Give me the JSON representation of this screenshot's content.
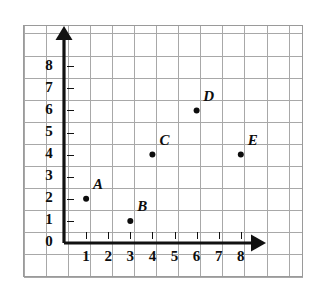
{
  "chart_data": {
    "type": "scatter",
    "title": "",
    "xlabel": "",
    "ylabel": "",
    "xlim": [
      0,
      9
    ],
    "ylim": [
      0,
      9
    ],
    "grid": true,
    "legend": null,
    "x_ticks": [
      "1",
      "2",
      "3",
      "4",
      "5",
      "6",
      "7",
      "8"
    ],
    "y_ticks": [
      "0",
      "1",
      "2",
      "3",
      "4",
      "5",
      "6",
      "7",
      "8"
    ],
    "x_tick_values": [
      1,
      2,
      3,
      4,
      5,
      6,
      7,
      8
    ],
    "y_tick_values": [
      0,
      1,
      2,
      3,
      4,
      5,
      6,
      7,
      8
    ],
    "points": [
      {
        "label": "A",
        "x": 1,
        "y": 2
      },
      {
        "label": "B",
        "x": 3,
        "y": 1
      },
      {
        "label": "C",
        "x": 4,
        "y": 4
      },
      {
        "label": "D",
        "x": 6,
        "y": 6
      },
      {
        "label": "E",
        "x": 8,
        "y": 4
      }
    ],
    "colors": {
      "grid": "#a8a8a8",
      "axis": "#111111",
      "point": "#0d0d0d",
      "background": "#ffffff"
    }
  }
}
